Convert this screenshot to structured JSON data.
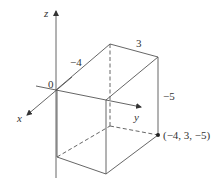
{
  "figure": {
    "type": "3d-rectangular-box",
    "axes": {
      "x_label": "x",
      "y_label": "y",
      "z_label": "z",
      "origin_label": "0"
    },
    "dimension_labels": {
      "x_length": "−4",
      "y_length": "3",
      "z_length": "−5"
    },
    "point_label": "(−4, 3, −5)",
    "colors": {
      "line": "#555555",
      "text": "#333333",
      "background": "#ffffff"
    }
  }
}
